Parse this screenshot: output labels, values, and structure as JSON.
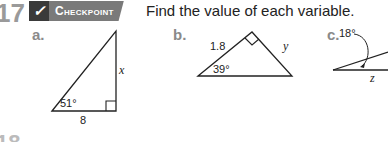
{
  "header": {
    "exercise_number": "17",
    "badge_icon": "checkmark-icon",
    "badge_label": "Checkpoint",
    "instruction": "Find the value of each variable."
  },
  "problems": [
    {
      "label": "a.",
      "figure": "right-triangle",
      "angle": "51°",
      "side_adjacent": "8",
      "unknown": "x"
    },
    {
      "label": "b.",
      "figure": "right-triangle",
      "hypotenuse_side": "1.8",
      "angle": "39°",
      "unknown": "y"
    },
    {
      "label": "c.",
      "figure": "angle-diagram",
      "angle": "18°",
      "unknown": "z"
    }
  ],
  "footer": {
    "next_number_partial": "18"
  },
  "colors": {
    "badge_dark": "#3a3a3a",
    "badge_gray": "#7a7a7a",
    "label_gray": "#8a8a8a",
    "number_gray": "#9a9a9a"
  }
}
